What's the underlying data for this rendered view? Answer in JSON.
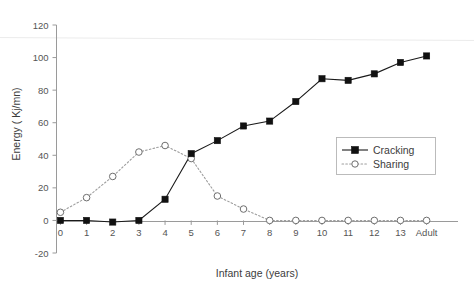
{
  "chart_data": {
    "type": "line",
    "title": "",
    "xlabel": "Infant age (years)",
    "ylabel": "Energy ( Kj/mn)",
    "categories": [
      "0",
      "1",
      "2",
      "3",
      "4",
      "5",
      "6",
      "7",
      "8",
      "9",
      "10",
      "11",
      "12",
      "13",
      "Adult"
    ],
    "xtick_labels": [
      "0",
      "1",
      "2",
      "3",
      "4",
      "5",
      "6",
      "7",
      "8",
      "9",
      "10",
      "11",
      "12",
      "13",
      "Adult"
    ],
    "ytick_labels": [
      "-20",
      "0",
      "20",
      "40",
      "60",
      "80",
      "100",
      "120"
    ],
    "yticks": [
      -20,
      0,
      20,
      40,
      60,
      80,
      100,
      120
    ],
    "ylim": [
      -20,
      120
    ],
    "grid": false,
    "legend_position": "center-right",
    "series": [
      {
        "name": "Cracking",
        "marker": "filled-square",
        "linestyle": "solid",
        "color": "#111111",
        "values": [
          0,
          0,
          -1,
          0,
          13,
          41,
          49,
          58,
          61,
          73,
          87,
          86,
          90,
          97,
          101
        ]
      },
      {
        "name": "Sharing",
        "marker": "open-circle",
        "linestyle": "dotted",
        "color": "#9d9d9d",
        "values": [
          5,
          14,
          27,
          42,
          46,
          38,
          15,
          7,
          0,
          0,
          0,
          0,
          0,
          0,
          0
        ]
      }
    ]
  },
  "legend": {
    "entries": [
      {
        "label": "Cracking"
      },
      {
        "label": "Sharing"
      }
    ]
  },
  "axes": {
    "x_title": "Infant age (years)",
    "y_title": "Energy ( Kj/mn)"
  }
}
